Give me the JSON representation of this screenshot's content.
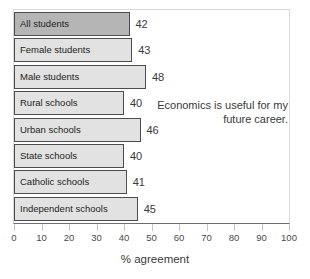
{
  "chart_data": {
    "type": "bar",
    "orientation": "horizontal",
    "title": "",
    "annotation": "Economics is useful for my future career.",
    "xlabel": "% agreement",
    "ylabel": "",
    "xlim": [
      0,
      100
    ],
    "xticks": [
      0,
      10,
      20,
      30,
      40,
      50,
      60,
      70,
      80,
      90,
      100
    ],
    "grid": false,
    "legend": "none",
    "categories": [
      "All students",
      "Female students",
      "Male students",
      "Rural schools",
      "Urban schools",
      "State schools",
      "Catholic schools",
      "Independent schools"
    ],
    "values": [
      42,
      43,
      48,
      40,
      46,
      40,
      41,
      45
    ],
    "highlight_index": 0,
    "colors": {
      "bar_fill": "#e2e2e2",
      "bar_highlight_fill": "#b5b5b5",
      "bar_border": "#4d4d4d",
      "axis_line": "#6e6e6e",
      "frame": "#d9d9d9",
      "text": "#231f20"
    }
  }
}
